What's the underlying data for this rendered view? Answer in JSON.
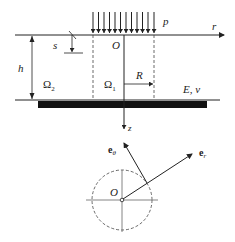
{
  "diagram": {
    "labels": {
      "load": "p",
      "r_axis": "r",
      "origin_top": "O",
      "s": "s",
      "h": "h",
      "omega2": "Ω",
      "omega2_sub": "2",
      "omega1": "Ω",
      "omega1_sub": "1",
      "R": "R",
      "material": "E, ν",
      "z_axis": "z",
      "e_theta": "e",
      "e_theta_sub": "θ",
      "e_r": "e",
      "e_r_sub": "r",
      "origin_bottom": "O"
    },
    "load_arrow_count": 12,
    "colors": {
      "line": "#222222",
      "dashed": "#444444",
      "substrate": "#111111",
      "background": "#ffffff"
    }
  }
}
